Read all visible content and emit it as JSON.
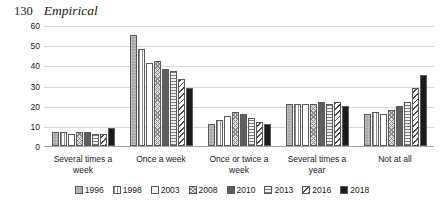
{
  "running_head": {
    "folio": "130",
    "title": "Empirical"
  },
  "chart_data": {
    "type": "bar",
    "title": "",
    "xlabel": "",
    "ylabel": "",
    "ylim": [
      0,
      60
    ],
    "yticks": [
      0,
      10,
      20,
      30,
      40,
      50,
      60
    ],
    "grid": true,
    "legend_position": "bottom",
    "categories": [
      "Several times a week",
      "Once a week",
      "Once or twice a week",
      "Several times a year",
      "Not at all"
    ],
    "series": [
      {
        "name": "1996",
        "pattern": "solid-light-gray",
        "values": [
          7,
          55,
          11,
          21,
          16
        ]
      },
      {
        "name": "1998",
        "pattern": "vertical-lines",
        "values": [
          7,
          48,
          13,
          21,
          17
        ]
      },
      {
        "name": "2003",
        "pattern": "white",
        "values": [
          6,
          41,
          15,
          21,
          16
        ]
      },
      {
        "name": "2008",
        "pattern": "crosshatch",
        "values": [
          7,
          42,
          17,
          21,
          18
        ]
      },
      {
        "name": "2010",
        "pattern": "solid-dark-gray",
        "values": [
          7,
          38,
          16,
          22,
          20
        ]
      },
      {
        "name": "2013",
        "pattern": "horizontal-lines",
        "values": [
          6,
          37,
          14,
          21,
          22
        ]
      },
      {
        "name": "2016",
        "pattern": "diagonal-hatch",
        "values": [
          6,
          33,
          12,
          22,
          29
        ]
      },
      {
        "name": "2018",
        "pattern": "solid-black",
        "values": [
          9,
          29,
          11,
          20,
          35
        ]
      }
    ]
  }
}
